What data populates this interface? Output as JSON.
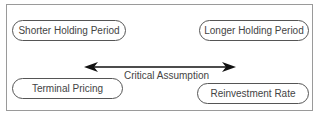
{
  "diagram": {
    "nodes": [
      {
        "id": "shorter",
        "label": "Shorter Holding Period"
      },
      {
        "id": "longer",
        "label": "Longer Holding Period"
      },
      {
        "id": "terminal",
        "label": "Terminal Pricing"
      },
      {
        "id": "reinvest",
        "label": "Reinvestment Rate"
      }
    ],
    "arrow": {
      "label": "Critical Assumption",
      "direction": "bidirectional"
    },
    "colors": {
      "stroke": "#555555",
      "arrow": "#111111",
      "frame": "#9a9a9a"
    }
  }
}
